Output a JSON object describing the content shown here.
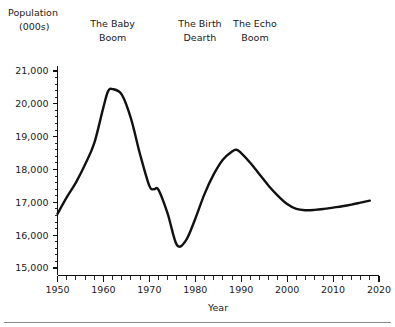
{
  "chart_data": {
    "type": "line",
    "title": "",
    "xlabel": "Year",
    "ylabel": "Population (000s)",
    "ylabel_line1": "Population",
    "ylabel_line2": "(000s)",
    "xlim": [
      1950,
      2020
    ],
    "ylim": [
      15000,
      21000
    ],
    "y_tick_step": 1000,
    "y_minor_step": 200,
    "x_tick_step": 10,
    "x_minor_step": 2,
    "grid": false,
    "legend": "none",
    "line_color": "#111111",
    "yticks": [
      "15,000",
      "16,000",
      "17,000",
      "18,000",
      "19,000",
      "20,000",
      "21,000"
    ],
    "ytick_values": [
      15000,
      16000,
      17000,
      18000,
      19000,
      20000,
      21000
    ],
    "xticks": [
      "1950",
      "1960",
      "1970",
      "1980",
      "1990",
      "2000",
      "2010",
      "2020"
    ],
    "xtick_values": [
      1950,
      1960,
      1970,
      1980,
      1990,
      2000,
      2010,
      2020
    ],
    "series": [
      {
        "name": "Population",
        "x": [
          1950,
          1952,
          1954,
          1956,
          1958,
          1960,
          1961,
          1962,
          1964,
          1966,
          1968,
          1970,
          1971,
          1972,
          1974,
          1976,
          1978,
          1980,
          1982,
          1984,
          1986,
          1988,
          1989,
          1990,
          1992,
          1994,
          1996,
          1998,
          2000,
          2002,
          2004,
          2006,
          2008,
          2010,
          2012,
          2014,
          2016,
          2018
        ],
        "values": [
          16650,
          17150,
          17600,
          18150,
          18800,
          19900,
          20380,
          20450,
          20280,
          19550,
          18450,
          17500,
          17400,
          17380,
          16650,
          15700,
          15850,
          16500,
          17250,
          17850,
          18300,
          18550,
          18600,
          18500,
          18200,
          17850,
          17500,
          17200,
          16950,
          16800,
          16760,
          16770,
          16800,
          16840,
          16880,
          16930,
          16990,
          17050
        ]
      }
    ],
    "annotations": [
      {
        "text_line1": "The Baby",
        "text_line2": "Boom",
        "x": 1962,
        "label": "The Baby Boom"
      },
      {
        "text_line1": "The Birth",
        "text_line2": "Dearth",
        "x": 1981,
        "label": "The Birth Dearth"
      },
      {
        "text_line1": "The Echo",
        "text_line2": "Boom",
        "x": 1993,
        "label": "The Echo Boom"
      }
    ]
  }
}
